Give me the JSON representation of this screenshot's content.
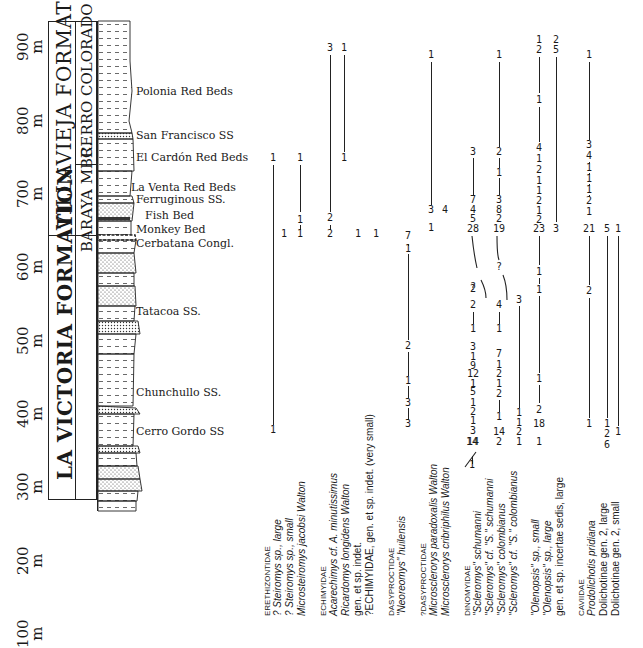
{
  "scale": {
    "unit": "m",
    "ticks": [
      {
        "label": "900",
        "y": 61
      },
      {
        "label": "800",
        "y": 135
      },
      {
        "label": "700",
        "y": 208
      },
      {
        "label": "600",
        "y": 281
      },
      {
        "label": "500",
        "y": 355
      },
      {
        "label": "400",
        "y": 428
      },
      {
        "label": "300",
        "y": 501
      },
      {
        "label": "200",
        "y": 575
      },
      {
        "label": "100",
        "y": 648
      }
    ]
  },
  "formations": [
    {
      "name": "VILLAVIEJA FORMATION",
      "top": 21,
      "bottom": 235
    },
    {
      "name": "LA VICTORIA FORMATION",
      "top": 235,
      "bottom": 500
    }
  ],
  "members": [
    {
      "name": "CERRO COLORADO MBR",
      "top": 21,
      "bottom": 164
    },
    {
      "name": "BARAYA MBR.",
      "top": 164,
      "bottom": 253
    }
  ],
  "units": [
    {
      "name": "Polonia Red Beds",
      "y": 92
    },
    {
      "name": "San Francisco SS",
      "y": 136
    },
    {
      "name": "El Cardón Red Beds",
      "y": 158
    },
    {
      "name": "La Venta Red Beds",
      "y": 188
    },
    {
      "name": "Ferruginous SS.",
      "y": 200
    },
    {
      "name": "Fish Bed",
      "y": 216
    },
    {
      "name": "Monkey Bed",
      "y": 230
    },
    {
      "name": "Cerbatana Congl.",
      "y": 244
    },
    {
      "name": "Tatacoa SS.",
      "y": 312
    },
    {
      "name": "Chunchullo SS.",
      "y": 393
    },
    {
      "name": "Cerro Gordo SS",
      "y": 432
    }
  ],
  "chart_data": {
    "type": "stratigraphic-range-chart",
    "title": "",
    "y_axis": {
      "label": "m",
      "ticks": [
        100,
        200,
        300,
        400,
        500,
        600,
        700,
        800,
        900
      ]
    },
    "families": [
      {
        "family": "ERETHIZONTIDAE",
        "taxa": [
          {
            "name": "? Steiromys sp., large",
            "x": 273,
            "counts": [
              {
                "n": "1",
                "y": 158
              },
              {
                "n": "1",
                "y": 430
              }
            ],
            "lines": [
              [
                165,
                425
              ]
            ]
          },
          {
            "name": "? Steiromys sp., small",
            "x": 284,
            "counts": [
              {
                "n": "1",
                "y": 234
              }
            ],
            "lines": []
          },
          {
            "name": "Microsteiromys jacobsi Walton",
            "x": 300,
            "counts": [
              {
                "n": "1",
                "y": 158
              },
              {
                "n": "1",
                "y": 220
              },
              {
                "n": "1",
                "y": 234
              }
            ],
            "lines": [
              [
                165,
                212
              ],
              [
                225,
                230
              ]
            ]
          }
        ]
      },
      {
        "family": "ECHIMYIDAE",
        "taxa": [
          {
            "name": "Acarechimys cf. A. minutissimus",
            "x": 330,
            "counts": [
              {
                "n": "3",
                "y": 48
              },
              {
                "n": "2",
                "y": 218
              },
              {
                "n": "2",
                "y": 234
              }
            ],
            "lines": [
              [
                55,
                212
              ],
              [
                225,
                230
              ]
            ]
          },
          {
            "name": "Ricardomys longidens Walton",
            "x": 344,
            "counts": [
              {
                "n": "1",
                "y": 48
              },
              {
                "n": "1",
                "y": 158
              }
            ],
            "lines": [
              [
                55,
                152
              ]
            ]
          },
          {
            "name": "gen. et sp. indet.",
            "x": 358,
            "counts": [
              {
                "n": "1",
                "y": 234
              }
            ],
            "lines": []
          },
          {
            "name": "?ECHIMYIDAE, gen. et sp. indet. (very small)",
            "x": 376,
            "counts": [
              {
                "n": "1",
                "y": 234
              }
            ],
            "lines": []
          }
        ]
      },
      {
        "family": "DASYPROCTIDAE",
        "taxa": [
          {
            "name": "\"Neoreomys\" huilensis",
            "x": 408,
            "counts": [
              {
                "n": "7",
                "y": 236
              },
              {
                "n": "1",
                "y": 249
              },
              {
                "n": "2",
                "y": 346
              },
              {
                "n": "1",
                "y": 381
              },
              {
                "n": "3",
                "y": 403
              },
              {
                "n": "3",
                "y": 424
              }
            ],
            "lines": [
              [
                244,
                246
              ],
              [
                254,
                340
              ],
              [
                352,
                376
              ],
              [
                386,
                398
              ],
              [
                408,
                420
              ]
            ]
          }
        ]
      },
      {
        "family": "?DASYPROCTIDAE",
        "taxa": [
          {
            "name": "Microsclerorys paradoxalis Walton",
            "x": 431,
            "counts": [
              {
                "n": "1",
                "y": 55
              },
              {
                "n": "3",
                "y": 210
              },
              {
                "n": "1",
                "y": 228
              }
            ],
            "lines": [
              [
                62,
                205
              ]
            ]
          },
          {
            "name": "Microsclerorys cribriphilus Walton",
            "x": 445,
            "counts": [
              {
                "n": "4",
                "y": 210
              }
            ],
            "lines": []
          }
        ]
      },
      {
        "family": "DINOMYIDAE",
        "taxa": [
          {
            "name": "\"Scleromys\" schumanni",
            "x": 472,
            "counts": [
              {
                "n": "1",
                "y": 465
              },
              {
                "n": "14",
                "y": 442
              }
            ],
            "lines": [
              [
                456,
                464
              ]
            ]
          },
          {
            "name": "\"Scleromys\" cf. \"S.\" schumanni",
            "x": 473,
            "counts": [
              {
                "n": "3",
                "y": 152
              },
              {
                "n": "7",
                "y": 200
              },
              {
                "n": "4",
                "y": 210
              },
              {
                "n": "5",
                "y": 219
              },
              {
                "n": "28",
                "y": 229
              },
              {
                "n": "?",
                "y": 287
              },
              {
                "n": "2",
                "y": 289
              },
              {
                "n": "2",
                "y": 305
              },
              {
                "n": "1",
                "y": 329
              },
              {
                "n": "3",
                "y": 347
              },
              {
                "n": "1",
                "y": 357
              },
              {
                "n": "9",
                "y": 366
              },
              {
                "n": "12",
                "y": 374
              },
              {
                "n": "1",
                "y": 384
              },
              {
                "n": "5",
                "y": 392
              },
              {
                "n": "1",
                "y": 403
              },
              {
                "n": "2",
                "y": 412
              },
              {
                "n": "1",
                "y": 421
              },
              {
                "n": "3",
                "y": 431
              },
              {
                "n": "14",
                "y": 442
              }
            ],
            "lines": [
              [
                158,
                195
              ],
              [
                312,
                324
              ]
            ]
          },
          {
            "name": "\"Scleromys\" colombianus",
            "x": 499,
            "counts": [
              {
                "n": "1",
                "y": 55
              },
              {
                "n": "2",
                "y": 152
              },
              {
                "n": "1",
                "y": 173
              },
              {
                "n": "3",
                "y": 200
              },
              {
                "n": "8",
                "y": 210
              },
              {
                "n": "2",
                "y": 219
              },
              {
                "n": "19",
                "y": 229
              },
              {
                "n": "?",
                "y": 267
              },
              {
                "n": "4",
                "y": 305
              },
              {
                "n": "1",
                "y": 329
              },
              {
                "n": "7",
                "y": 354
              },
              {
                "n": "1",
                "y": 365
              },
              {
                "n": "2",
                "y": 374
              },
              {
                "n": "1",
                "y": 384
              },
              {
                "n": "2",
                "y": 394
              },
              {
                "n": "1",
                "y": 417
              },
              {
                "n": "14",
                "y": 432
              },
              {
                "n": "2",
                "y": 442
              }
            ],
            "lines": [
              [
                62,
                147
              ],
              [
                158,
                168
              ],
              [
                178,
                195
              ],
              [
                312,
                324
              ],
              [
                400,
                412
              ]
            ]
          },
          {
            "name": "\"Scleromys\" cf. \"S.\" colombianus",
            "x": 519,
            "counts": [
              {
                "n": "3",
                "y": 300
              },
              {
                "n": "1",
                "y": 413
              },
              {
                "n": "1",
                "y": 423
              },
              {
                "n": "2",
                "y": 432
              },
              {
                "n": "1",
                "y": 442
              }
            ],
            "lines": [
              [
                306,
                408
              ]
            ]
          }
        ]
      },
      {
        "family": "",
        "taxa": [
          {
            "name": "\"Olenopsis\" sp., small",
            "x": 525,
            "counts": [],
            "lines": []
          },
          {
            "name": "\"Olenopsis\" sp., large",
            "x": 539,
            "counts": [
              {
                "n": "1",
                "y": 40
              },
              {
                "n": "2",
                "y": 50
              },
              {
                "n": "1",
                "y": 100
              },
              {
                "n": "4",
                "y": 148
              },
              {
                "n": "1",
                "y": 159
              },
              {
                "n": "2",
                "y": 170
              },
              {
                "n": "1",
                "y": 181
              },
              {
                "n": "1",
                "y": 191
              },
              {
                "n": "2",
                "y": 201
              },
              {
                "n": "1",
                "y": 211
              },
              {
                "n": "2",
                "y": 220
              },
              {
                "n": "23",
                "y": 229
              },
              {
                "n": "1",
                "y": 272
              },
              {
                "n": "1",
                "y": 290
              },
              {
                "n": "1",
                "y": 379
              },
              {
                "n": "2",
                "y": 410
              },
              {
                "n": "18",
                "y": 424
              },
              {
                "n": "1",
                "y": 442
              }
            ],
            "lines": [
              [
                57,
                93
              ],
              [
                107,
                142
              ],
              [
                236,
                265
              ],
              [
                278,
                284
              ],
              [
                296,
                373
              ],
              [
                385,
                403
              ]
            ]
          },
          {
            "name": "gen. et sp. incertae sedis, large",
            "x": 556,
            "counts": [
              {
                "n": "2",
                "y": 40
              },
              {
                "n": "5",
                "y": 50
              },
              {
                "n": "3",
                "y": 229
              }
            ],
            "lines": [
              [
                57,
                222
              ]
            ]
          }
        ]
      },
      {
        "family": "CAVIIDAE",
        "taxa": [
          {
            "name": "Prodolichotis pridiana",
            "x": 589,
            "counts": [
              {
                "n": "1",
                "y": 55
              },
              {
                "n": "3",
                "y": 145
              },
              {
                "n": "4",
                "y": 156
              },
              {
                "n": "1",
                "y": 168
              },
              {
                "n": "1",
                "y": 179
              },
              {
                "n": "1",
                "y": 190
              },
              {
                "n": "2",
                "y": 201
              },
              {
                "n": "1",
                "y": 212
              },
              {
                "n": "21",
                "y": 229
              },
              {
                "n": "2",
                "y": 291
              },
              {
                "n": "1",
                "y": 424
              }
            ],
            "lines": [
              [
                62,
                140
              ],
              [
                162,
                164
              ],
              [
                173,
                175
              ],
              [
                184,
                186
              ],
              [
                195,
                197
              ],
              [
                236,
                285
              ],
              [
                298,
                418
              ]
            ]
          },
          {
            "name": "Dolichotinae gen. 2, large",
            "x": 607,
            "counts": [
              {
                "n": "5",
                "y": 229
              },
              {
                "n": "1",
                "y": 424
              },
              {
                "n": "2",
                "y": 434
              },
              {
                "n": "6",
                "y": 445
              }
            ],
            "lines": [
              [
                236,
                418
              ]
            ]
          },
          {
            "name": "Dolichotinae gen. 2, small",
            "x": 618,
            "counts": [
              {
                "n": "1",
                "y": 229
              },
              {
                "n": "1",
                "y": 432
              }
            ],
            "lines": [
              [
                236,
                426
              ]
            ]
          }
        ]
      }
    ]
  }
}
